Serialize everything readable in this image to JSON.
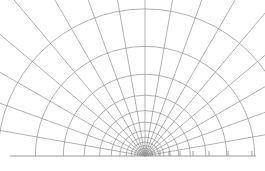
{
  "figure": {
    "title": "",
    "type": "polar-grid-diagram",
    "background_color": "#ffffff",
    "width": 265,
    "height": 171
  },
  "chart_data": {
    "type": "scatter",
    "title": "",
    "xlabel": "",
    "ylabel": "",
    "origin": {
      "x": 145,
      "y": 156
    },
    "angle_range_deg": [
      0,
      180
    ],
    "spoke_count": 19,
    "spoke_angles_deg": [
      0,
      10,
      20,
      30,
      40,
      50,
      60,
      70,
      80,
      90,
      100,
      110,
      120,
      130,
      140,
      150,
      160,
      170,
      180
    ],
    "arc_radii_px": [
      3.2,
      4.3,
      5.8,
      7.8,
      10.4,
      14.0,
      18.8,
      25.2,
      33.8,
      45.4,
      60.9,
      81.7,
      109.6,
      147.1
    ],
    "arc_count": 14,
    "arc_spacing_ratio": 1.342,
    "baseline": {
      "y": 156,
      "x_start": 10,
      "x_end": 256,
      "color": "#8c8c8c"
    },
    "ticks": {
      "axis": "x",
      "side": "right",
      "positions_px": [
        152,
        160,
        169,
        180,
        193,
        209,
        228,
        252
      ],
      "length_px": 5,
      "count": 8
    },
    "grid": true,
    "legend": null,
    "line_color": "#8f8f8f",
    "line_width_px": 0.7
  }
}
